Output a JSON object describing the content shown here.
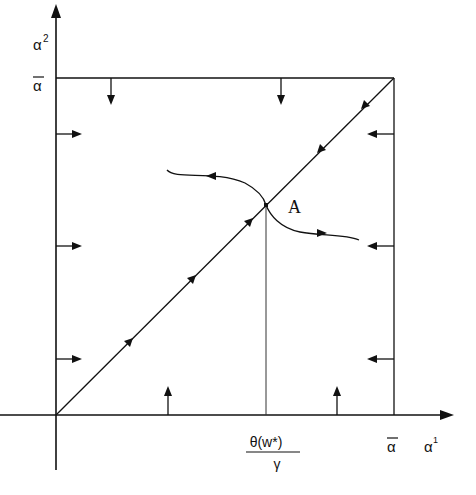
{
  "diagram": {
    "y_axis_label": "α",
    "y_axis_sup": "2",
    "x_axis_label": "α",
    "x_axis_sup": "1",
    "y_bar_label": "α",
    "x_bar_label": "α",
    "equilibrium_label": "A",
    "threshold_numerator": "θ(w*)",
    "threshold_denominator": "γ",
    "colors": {
      "ink": "#111111",
      "background": "#ffffff"
    }
  }
}
